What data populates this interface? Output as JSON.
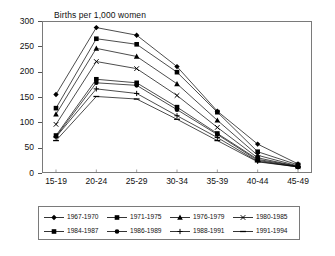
{
  "chart_data": {
    "type": "line",
    "title": "Births per 1,000 women",
    "xlabel": "",
    "ylabel": "",
    "ylim": [
      0,
      300
    ],
    "yticks": [
      0,
      50,
      100,
      150,
      200,
      250,
      300
    ],
    "ytick_labels": [
      "0",
      "50",
      "100",
      "150",
      "200",
      "250",
      "300"
    ],
    "grid": false,
    "legend_position": "bottom",
    "categories": [
      "15-19",
      "20-24",
      "25-29",
      "30-34",
      "35-39",
      "40-44",
      "45-49"
    ],
    "series": [
      {
        "name": "1967-1970",
        "marker": "diamond",
        "values": [
          155,
          287,
          272,
          210,
          122,
          57,
          18
        ]
      },
      {
        "name": "1971-1975",
        "marker": "square",
        "values": [
          128,
          265,
          254,
          199,
          120,
          42,
          16
        ]
      },
      {
        "name": "1976-1979",
        "marker": "triangle",
        "values": [
          116,
          246,
          230,
          176,
          104,
          35,
          14
        ]
      },
      {
        "name": "1980-1985",
        "marker": "cross",
        "values": [
          96,
          220,
          206,
          153,
          90,
          30,
          13
        ]
      },
      {
        "name": "1984-1987",
        "marker": "square",
        "values": [
          74,
          185,
          178,
          130,
          78,
          27,
          13
        ]
      },
      {
        "name": "1986-1989",
        "marker": "circle",
        "values": [
          72,
          178,
          173,
          125,
          76,
          25,
          12
        ]
      },
      {
        "name": "1988-1991",
        "marker": "plus",
        "values": [
          71,
          166,
          157,
          113,
          70,
          23,
          12
        ]
      },
      {
        "name": "1991-1994",
        "marker": "dash",
        "values": [
          64,
          151,
          146,
          106,
          64,
          22,
          12
        ]
      }
    ]
  },
  "legend": {
    "rows": [
      [
        "1967-1970",
        "1971-1975",
        "1976-1979",
        "1980-1985"
      ],
      [
        "1984-1987",
        "1986-1989",
        "1988-1991",
        "1991-1994"
      ]
    ]
  }
}
